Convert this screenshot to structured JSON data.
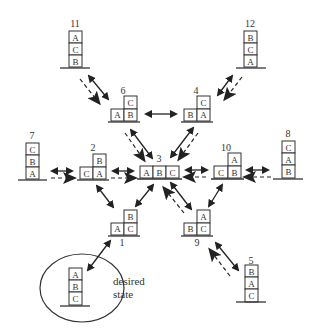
{
  "desired_label": [
    "desired",
    "state"
  ],
  "states": {
    "s1": {
      "label": "1",
      "blocks": {
        "left": "A",
        "right": "C",
        "top": "B"
      }
    },
    "s2": {
      "label": "2",
      "blocks": {
        "left": "C",
        "right": "A",
        "top": "B"
      }
    },
    "s3": {
      "label": "3",
      "blocks": {
        "a": "A",
        "b": "B",
        "c": "C"
      }
    },
    "s4": {
      "label": "4",
      "blocks": {
        "left": "B",
        "right": "A",
        "top": "C"
      }
    },
    "s5": {
      "label": "5",
      "blocks": {
        "top": "B",
        "mid": "A",
        "bot": "C"
      }
    },
    "s6": {
      "label": "6",
      "blocks": {
        "left": "A",
        "right": "B",
        "top": "C"
      }
    },
    "s7": {
      "label": "7",
      "blocks": {
        "top": "C",
        "mid": "B",
        "bot": "A"
      }
    },
    "s8": {
      "label": "8",
      "blocks": {
        "top": "C",
        "mid": "A",
        "bot": "B"
      }
    },
    "s9": {
      "label": "9",
      "blocks": {
        "left": "B",
        "right": "C",
        "top": "A"
      }
    },
    "s10": {
      "label": "10",
      "blocks": {
        "left": "C",
        "right": "B",
        "top": "A"
      }
    },
    "s11": {
      "label": "11",
      "blocks": {
        "top": "A",
        "mid": "C",
        "bot": "B"
      }
    },
    "s12": {
      "label": "12",
      "blocks": {
        "top": "B",
        "mid": "C",
        "bot": "A"
      }
    },
    "desired": {
      "blocks": {
        "top": "A",
        "mid": "B",
        "bot": "C"
      }
    }
  },
  "edges": [
    {
      "from": "11",
      "to": "6",
      "type": "bidirectional+dashed-toward-6"
    },
    {
      "from": "12",
      "to": "4",
      "type": "bidirectional+dashed-toward-4"
    },
    {
      "from": "6",
      "to": "4",
      "type": "bidirectional"
    },
    {
      "from": "6",
      "to": "3",
      "type": "bidirectional+dashed-toward-3"
    },
    {
      "from": "4",
      "to": "3",
      "type": "bidirectional+dashed-toward-3"
    },
    {
      "from": "7",
      "to": "2",
      "type": "bidirectional+dashed-toward-2"
    },
    {
      "from": "2",
      "to": "3",
      "type": "bidirectional+dashed-toward-3"
    },
    {
      "from": "8",
      "to": "10",
      "type": "bidirectional+dashed-toward-10"
    },
    {
      "from": "10",
      "to": "3",
      "type": "bidirectional+dashed-toward-3"
    },
    {
      "from": "2",
      "to": "1",
      "type": "bidirectional"
    },
    {
      "from": "3",
      "to": "1",
      "type": "bidirectional"
    },
    {
      "from": "10",
      "to": "9",
      "type": "bidirectional"
    },
    {
      "from": "9",
      "to": "3",
      "type": "bidirectional+dashed-toward-3"
    },
    {
      "from": "5",
      "to": "9",
      "type": "bidirectional+dashed-toward-9"
    },
    {
      "from": "1",
      "to": "desired",
      "type": "bidirectional"
    }
  ]
}
